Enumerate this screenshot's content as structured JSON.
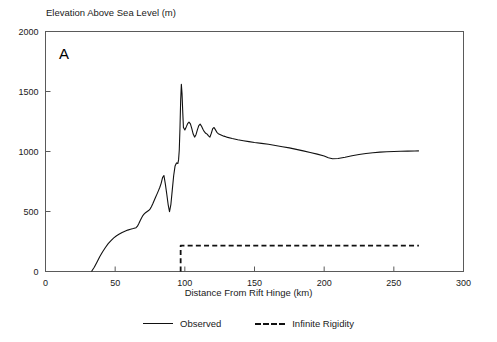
{
  "figure": {
    "panel_label": "A",
    "clipped_header": "",
    "axis_color": "#5a5a5a",
    "curve_color": "#111111"
  },
  "chart_data": {
    "type": "line",
    "title": "",
    "xlabel": "Distance From Rift Hinge (km)",
    "ylabel": "Elevation Above Sea Level (m)",
    "xlim": [
      0,
      300
    ],
    "ylim": [
      0,
      2000
    ],
    "xticks": [
      0,
      50,
      100,
      150,
      200,
      250,
      300
    ],
    "yticks": [
      0,
      500,
      1000,
      1500,
      2000
    ],
    "xtick_labels": [
      "0",
      "50",
      "100",
      "150",
      "200",
      "250",
      "300"
    ],
    "ytick_labels": [
      "0",
      "500",
      "1000",
      "1500",
      "2000"
    ],
    "grid": false,
    "legend_position": "below",
    "series": [
      {
        "name": "Observed",
        "style": "solid",
        "color": "#111111",
        "x": [
          33,
          35,
          37,
          39,
          41,
          43,
          45,
          47,
          49,
          51,
          53,
          55,
          57,
          59,
          61,
          63,
          65,
          66,
          67,
          68,
          69,
          70,
          71,
          72,
          73,
          74,
          75,
          76,
          77,
          78,
          79,
          80,
          81,
          82,
          83,
          84,
          85,
          86,
          87,
          88,
          89,
          90,
          91,
          92,
          93,
          94,
          95,
          95.5,
          96,
          96.5,
          97,
          97.5,
          98,
          98.5,
          99,
          100,
          101,
          102,
          103,
          104,
          105,
          106,
          107,
          108,
          109,
          110,
          111,
          112,
          113,
          114,
          115,
          116,
          117,
          118,
          119,
          120,
          121,
          122,
          123,
          124,
          126,
          128,
          130,
          134,
          138,
          142,
          146,
          150,
          155,
          160,
          165,
          170,
          175,
          180,
          185,
          190,
          195,
          200,
          203,
          206,
          210,
          215,
          220,
          225,
          230,
          235,
          240,
          245,
          250,
          255,
          260,
          265,
          268
        ],
        "y": [
          0,
          35,
          80,
          125,
          165,
          200,
          232,
          258,
          280,
          298,
          312,
          325,
          336,
          345,
          352,
          358,
          365,
          378,
          400,
          425,
          448,
          468,
          482,
          492,
          500,
          508,
          520,
          540,
          565,
          592,
          618,
          645,
          672,
          700,
          735,
          782,
          800,
          730,
          648,
          560,
          498,
          560,
          680,
          800,
          880,
          905,
          900,
          930,
          1010,
          1190,
          1420,
          1560,
          1480,
          1330,
          1200,
          1180,
          1205,
          1232,
          1245,
          1230,
          1190,
          1145,
          1120,
          1140,
          1180,
          1215,
          1228,
          1210,
          1185,
          1165,
          1152,
          1145,
          1130,
          1120,
          1152,
          1190,
          1200,
          1180,
          1160,
          1148,
          1138,
          1128,
          1120,
          1108,
          1098,
          1090,
          1082,
          1075,
          1068,
          1060,
          1050,
          1040,
          1030,
          1018,
          1005,
          992,
          978,
          962,
          948,
          940,
          942,
          952,
          965,
          975,
          983,
          990,
          995,
          998,
          1000,
          1002,
          1003,
          1004,
          1005
        ]
      },
      {
        "name": "Infinite Rigidity",
        "style": "dashed",
        "color": "#111111",
        "x": [
          97,
          97,
          268
        ],
        "y": [
          0,
          215,
          215
        ]
      }
    ],
    "legend_entries": [
      {
        "label": "Observed",
        "style": "solid"
      },
      {
        "label": "Infinite Rigidity",
        "style": "dashed"
      }
    ]
  }
}
